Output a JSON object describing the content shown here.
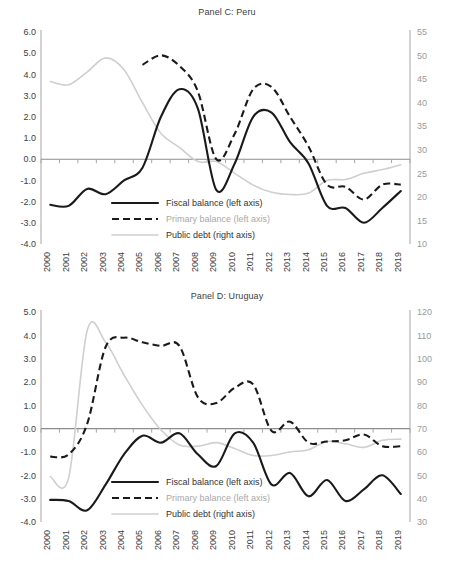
{
  "figure": {
    "panels": [
      {
        "id": "panelC",
        "title": "Panel C: Peru",
        "legend": [
          {
            "label": "Fiscal balance (left axis)",
            "style": "solid-black"
          },
          {
            "label": "Primary balance (left axis)",
            "style": "dashed-black"
          },
          {
            "label": "Public debt (right axis)",
            "style": "solid-grey"
          }
        ]
      },
      {
        "id": "panelD",
        "title": "Panel D: Uruguay",
        "legend": [
          {
            "label": "Fiscal balance (left axis)",
            "style": "solid-black"
          },
          {
            "label": "Primary balance (left axis)",
            "style": "dashed-black"
          },
          {
            "label": "Public debt (right axis)",
            "style": "solid-grey"
          }
        ]
      }
    ]
  },
  "chart_data": [
    {
      "type": "line",
      "id": "panelC",
      "title": "Panel C: Peru",
      "xlabel": "",
      "ylabel": "",
      "grid": false,
      "legend_position": "inside-bottom-center",
      "x": [
        2000,
        2001,
        2002,
        2003,
        2004,
        2005,
        2006,
        2007,
        2008,
        2009,
        2010,
        2011,
        2012,
        2013,
        2014,
        2015,
        2016,
        2017,
        2018,
        2019
      ],
      "xticklabels": [
        "2000",
        "2001",
        "2002",
        "2003",
        "2004",
        "2005",
        "2006",
        "2007",
        "2008",
        "2009",
        "2010",
        "2011",
        "2012",
        "2013",
        "2014",
        "2015",
        "2016",
        "2017",
        "2018",
        "2019"
      ],
      "left_axis": {
        "min": -4.0,
        "max": 6.0,
        "step": 1.0,
        "ticklabels": [
          "-4.0",
          "-3.0",
          "-2.0",
          "-1.0",
          "0.0",
          "1.0",
          "2.0",
          "3.0",
          "4.0",
          "5.0",
          "6.0"
        ]
      },
      "right_axis": {
        "min": 10,
        "max": 55,
        "step": 5,
        "ticklabels": [
          "10",
          "15",
          "20",
          "25",
          "30",
          "35",
          "40",
          "45",
          "50",
          "55"
        ]
      },
      "series": [
        {
          "name": "Fiscal balance (left axis)",
          "axis": "left",
          "style": "solid-black",
          "color": "#1a1a1a",
          "values": [
            -2.15,
            -2.2,
            -1.4,
            -1.65,
            -1.0,
            -0.4,
            2.0,
            3.3,
            2.4,
            -1.45,
            -0.2,
            2.0,
            2.2,
            0.8,
            -0.2,
            -2.2,
            -2.3,
            -3.0,
            -2.3,
            -1.5
          ]
        },
        {
          "name": "Primary balance (left axis)",
          "axis": "left",
          "style": "dashed-black",
          "color": "#1a1a1a",
          "values": [
            null,
            null,
            null,
            null,
            null,
            4.45,
            4.9,
            4.4,
            3.2,
            0.0,
            1.2,
            3.3,
            3.4,
            2.0,
            0.6,
            -1.2,
            -1.3,
            -1.9,
            -1.2,
            -1.2
          ]
        },
        {
          "name": "Public debt (right axis)",
          "axis": "right",
          "style": "solid-grey",
          "color": "#cfcfcf",
          "values": [
            44.5,
            43.8,
            46.5,
            49.5,
            47.0,
            40.0,
            33.5,
            30.5,
            27.5,
            27.5,
            25.0,
            22.5,
            21.0,
            20.5,
            20.8,
            23.5,
            23.7,
            25.0,
            25.8,
            26.8
          ]
        }
      ]
    },
    {
      "type": "line",
      "id": "panelD",
      "title": "Panel D: Uruguay",
      "xlabel": "",
      "ylabel": "",
      "grid": false,
      "legend_position": "inside-bottom-center",
      "x": [
        2000,
        2001,
        2002,
        2003,
        2004,
        2005,
        2006,
        2007,
        2008,
        2009,
        2010,
        2011,
        2012,
        2013,
        2014,
        2015,
        2016,
        2017,
        2018,
        2019
      ],
      "xticklabels": [
        "2000",
        "2001",
        "2002",
        "2003",
        "2004",
        "2005",
        "2006",
        "2007",
        "2008",
        "2009",
        "2010",
        "2011",
        "2012",
        "2013",
        "2014",
        "2015",
        "2016",
        "2017",
        "2018",
        "2019"
      ],
      "left_axis": {
        "min": -4.0,
        "max": 5.0,
        "step": 1.0,
        "ticklabels": [
          "-4.0",
          "-3.0",
          "-2.0",
          "-1.0",
          "0.0",
          "1.0",
          "2.0",
          "3.0",
          "4.0",
          "5.0"
        ]
      },
      "right_axis": {
        "min": 30,
        "max": 120,
        "step": 10,
        "ticklabels": [
          "30",
          "40",
          "50",
          "60",
          "70",
          "80",
          "90",
          "100",
          "110",
          "120"
        ]
      },
      "series": [
        {
          "name": "Fiscal balance (left axis)",
          "axis": "left",
          "style": "solid-black",
          "color": "#1a1a1a",
          "values": [
            -3.05,
            -3.1,
            -3.5,
            -2.4,
            -1.1,
            -0.3,
            -0.6,
            -0.2,
            -1.1,
            -1.6,
            -0.2,
            -0.6,
            -2.4,
            -1.9,
            -2.9,
            -2.2,
            -3.1,
            -2.6,
            -2.0,
            -2.8
          ]
        },
        {
          "name": "Primary balance (left axis)",
          "axis": "left",
          "style": "dashed-black",
          "color": "#1a1a1a",
          "values": [
            -1.2,
            -1.1,
            0.2,
            3.5,
            3.9,
            3.7,
            3.55,
            3.55,
            1.35,
            1.1,
            1.75,
            1.9,
            -0.1,
            0.3,
            -0.6,
            -0.55,
            -0.5,
            -0.25,
            -0.75,
            -0.75
          ]
        },
        {
          "name": "Public debt (right axis)",
          "axis": "right",
          "style": "solid-grey",
          "color": "#cfcfcf",
          "values": [
            49.5,
            49.0,
            112.0,
            107.0,
            93.0,
            80.0,
            69.5,
            63.0,
            62.5,
            64.0,
            61.5,
            58.5,
            58.5,
            60.0,
            61.0,
            64.5,
            63.5,
            62.0,
            65.0,
            65.5
          ]
        }
      ]
    }
  ]
}
